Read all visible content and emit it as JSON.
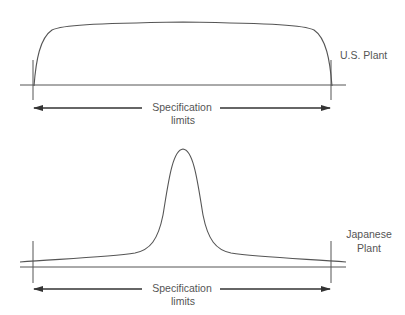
{
  "top_panel": {
    "plant_label": "U.S. Plant",
    "spec_label_line1": "Specification",
    "spec_label_line2": "limits",
    "distribution": "flat-wide"
  },
  "bottom_panel": {
    "plant_label_line1": "Japanese",
    "plant_label_line2": "Plant",
    "spec_label_line1": "Specification",
    "spec_label_line2": "limits",
    "distribution": "narrow-peaked"
  },
  "colors": {
    "stroke": "#555555",
    "text": "#555555",
    "background": "#ffffff"
  }
}
